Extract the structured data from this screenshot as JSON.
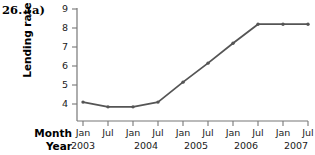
{
  "figure": {
    "label": "26. (a)"
  },
  "chart_data": {
    "type": "line",
    "title": "",
    "xlabel": "",
    "ylabel": "Lending rate",
    "ylim": [
      3.4,
      9
    ],
    "yticks": [
      4,
      5,
      6,
      7,
      8,
      9
    ],
    "ytick_labels": [
      "4",
      "5",
      "6",
      "7",
      "8",
      "9"
    ],
    "grid": false,
    "legend": false,
    "x_axis_rows": {
      "month_row_label": "Month",
      "year_row_label": "Year"
    },
    "categories": [
      "Jan 2003",
      "Jul 2003",
      "Jan 2004",
      "Jul 2004",
      "Jan 2005",
      "Jul 2005",
      "Jan 2006",
      "Jul 2006",
      "Jan 2007",
      "Jul 2007"
    ],
    "month_ticks": [
      "Jan",
      "Jul",
      "Jan",
      "Jul",
      "Jan",
      "Jul",
      "Jan",
      "Jul",
      "Jan",
      "Jul"
    ],
    "year_ticks": [
      "2003",
      "2004",
      "2005",
      "2006",
      "2007"
    ],
    "values": [
      4.1,
      3.85,
      3.85,
      4.1,
      5.15,
      6.15,
      7.2,
      8.2,
      8.2,
      8.2
    ],
    "series": [
      {
        "name": "Lending rate",
        "values": [
          4.1,
          3.85,
          3.85,
          4.1,
          5.15,
          6.15,
          7.2,
          8.2,
          8.2,
          8.2
        ]
      }
    ],
    "colors": {
      "line": "#555555",
      "marker": "#555555",
      "axis": "#777777",
      "text": "#1a1a1a",
      "background": "#ffffff"
    }
  }
}
